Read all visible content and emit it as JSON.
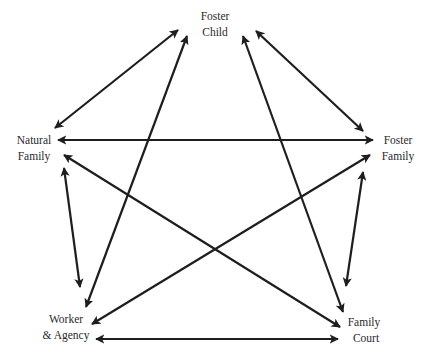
{
  "diagram": {
    "type": "relationship-network",
    "background_color": "#ffffff",
    "line_color": "#1e1e1e",
    "text_color": "#2a2a2a",
    "nodes": [
      {
        "id": "foster-child",
        "lines": [
          "Foster",
          "Child"
        ]
      },
      {
        "id": "natural-family",
        "lines": [
          "Natural",
          "Family"
        ]
      },
      {
        "id": "foster-family",
        "lines": [
          "Foster",
          "Family"
        ]
      },
      {
        "id": "worker-agency",
        "lines": [
          "Worker",
          "& Agency"
        ]
      },
      {
        "id": "family-court",
        "lines": [
          "Family",
          "Court"
        ]
      }
    ],
    "edges": [
      {
        "from": "natural-family",
        "to": "foster-child",
        "direction": "both"
      },
      {
        "from": "foster-child",
        "to": "foster-family",
        "direction": "both"
      },
      {
        "from": "natural-family",
        "to": "foster-family",
        "direction": "both"
      },
      {
        "from": "worker-agency",
        "to": "foster-child",
        "direction": "both"
      },
      {
        "from": "family-court",
        "to": "foster-child",
        "direction": "both"
      },
      {
        "from": "natural-family",
        "to": "worker-agency",
        "direction": "both"
      },
      {
        "from": "natural-family",
        "to": "family-court",
        "direction": "both"
      },
      {
        "from": "worker-agency",
        "to": "foster-family",
        "direction": "both"
      },
      {
        "from": "foster-family",
        "to": "family-court",
        "direction": "both"
      },
      {
        "from": "worker-agency",
        "to": "family-court",
        "direction": "both"
      }
    ]
  }
}
